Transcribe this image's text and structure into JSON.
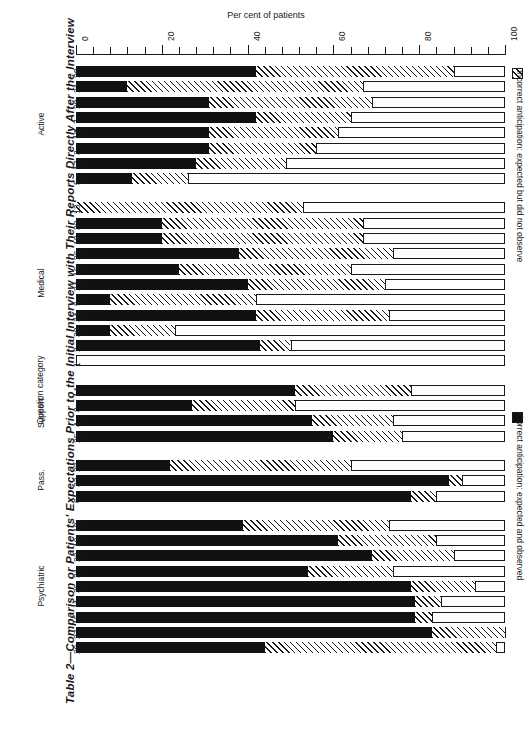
{
  "figure": {
    "title": "Table 2—Comparison or Patients' Expectations Prior to the Initial Interview with Their Reports Directly After the Interview",
    "x_axis_title": "Per cent of patients",
    "y_axis_title": "Question category"
  },
  "legend": {
    "items": [
      {
        "key": "incorrect",
        "swatch": "hatched-square",
        "label": "Incorrect anticipation: expected but did not observe"
      },
      {
        "key": "correct",
        "swatch": "solid-black-square",
        "label": "Correct anticipation: expected and observed"
      }
    ]
  },
  "axis": {
    "min": 0,
    "max": 100,
    "major_ticks": [
      0,
      20,
      40,
      60,
      80,
      100
    ],
    "major_tick_labels": [
      "0",
      "20",
      "40",
      "60",
      "80",
      "100"
    ],
    "minor_tick_step": 4
  },
  "colors": {
    "ink": "#1a1a1a",
    "correct": "#111111",
    "incorrect_hatch": "#1a1a1a",
    "background": "#ffffff"
  },
  "chart_data": {
    "type": "bar",
    "orientation": "horizontal",
    "stacked": true,
    "title": "Table 2—Comparison or Patients' Expectations Prior to the Initial Interview with Their Reports Directly After the Interview",
    "xlabel": "Per cent of patients",
    "ylabel": "Question category",
    "xlim": [
      0,
      100
    ],
    "grid": false,
    "legend_position": "right",
    "series": [
      {
        "name": "Correct anticipation: expected and observed",
        "key": "correct"
      },
      {
        "name": "Incorrect anticipation: expected but did not observe",
        "key": "incorrect"
      }
    ],
    "groups": [
      {
        "name": "Active",
        "rows": [
          {
            "category": "20",
            "correct": 42,
            "incorrect": 46
          },
          {
            "category": "21",
            "correct": 12,
            "incorrect": 55
          },
          {
            "category": "28",
            "correct": 31,
            "incorrect": 38
          },
          {
            "category": "7",
            "correct": 42,
            "incorrect": 22
          },
          {
            "category": "12",
            "correct": 31,
            "incorrect": 30
          },
          {
            "category": "3",
            "correct": 31,
            "incorrect": 25
          },
          {
            "category": "17",
            "correct": 28,
            "incorrect": 21
          },
          {
            "category": "5",
            "correct": 13,
            "incorrect": 13
          }
        ]
      },
      {
        "name": "Medical",
        "rows": [
          {
            "category": "13",
            "correct": 0,
            "incorrect": 53
          },
          {
            "category": "32",
            "correct": 20,
            "incorrect": 47
          },
          {
            "category": "18",
            "correct": 20,
            "incorrect": 47
          },
          {
            "category": "26",
            "correct": 38,
            "incorrect": 36
          },
          {
            "category": "16",
            "correct": 24,
            "incorrect": 40
          },
          {
            "category": "24",
            "correct": 40,
            "incorrect": 32
          },
          {
            "category": "9",
            "correct": 8,
            "incorrect": 34
          },
          {
            "category": "34",
            "correct": 42,
            "incorrect": 31
          },
          {
            "category": "30",
            "correct": 8,
            "incorrect": 15
          },
          {
            "category": "2",
            "correct": 43,
            "incorrect": 7
          },
          {
            "category": "1",
            "correct": 0,
            "incorrect": 0
          }
        ]
      },
      {
        "name": "Support.",
        "rows": [
          {
            "category": "14",
            "correct": 51,
            "incorrect": 27
          },
          {
            "category": "8",
            "correct": 27,
            "incorrect": 24
          },
          {
            "category": "4",
            "correct": 55,
            "incorrect": 19
          },
          {
            "category": "25",
            "correct": 60,
            "incorrect": 16
          }
        ]
      },
      {
        "name": "Pass.",
        "rows": [
          {
            "category": "23",
            "correct": 22,
            "incorrect": 42
          },
          {
            "category": "33",
            "correct": 87,
            "incorrect": 3
          },
          {
            "category": "6",
            "correct": 78,
            "incorrect": 6
          }
        ]
      },
      {
        "name": "Psychiatric",
        "rows": [
          {
            "category": "10",
            "correct": 39,
            "incorrect": 34
          },
          {
            "category": "19",
            "correct": 61,
            "incorrect": 23
          },
          {
            "category": "22",
            "correct": 69,
            "incorrect": 19
          },
          {
            "category": "31",
            "correct": 54,
            "incorrect": 20
          },
          {
            "category": "35",
            "correct": 78,
            "incorrect": 15
          },
          {
            "category": "11",
            "correct": 79,
            "incorrect": 6
          },
          {
            "category": "15",
            "correct": 79,
            "incorrect": 4
          },
          {
            "category": "27",
            "correct": 83,
            "incorrect": 17
          },
          {
            "category": "29",
            "correct": 44,
            "incorrect": 54
          }
        ]
      }
    ]
  },
  "layout": {
    "plot_left_px": 76,
    "plot_right_px": 505,
    "axis_y_px": 54,
    "row_height_px": 11,
    "row_pitch_px": 15.3,
    "group_gaps_px": 14,
    "first_row_top_px": 66
  }
}
